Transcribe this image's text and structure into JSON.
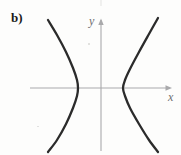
{
  "figure": {
    "part_label": "b)",
    "axis_labels": {
      "x": "x",
      "y": "y"
    },
    "colors": {
      "curve": "#2b2b2b",
      "axis": "#a9a9ab",
      "label_text": "#1a1a1a",
      "axis_label_text": "#6e6e70",
      "background": "#fdfdfc"
    }
  },
  "chart_data": {
    "type": "line",
    "title": "",
    "subtitle": "",
    "xlabel": "x",
    "ylabel": "y",
    "grid": false,
    "legend": null,
    "axes": {
      "origin_px": [
        101,
        88
      ],
      "x_axis_px": {
        "x1": 30,
        "y1": 88,
        "x2": 172,
        "y2": 88,
        "arrow": "right"
      },
      "y_axis_px": {
        "x1": 101,
        "y1": 18,
        "x2": 101,
        "y2": 151,
        "arrow": "up"
      },
      "xlim": [
        -3.6,
        1.8
      ],
      "ylim": [
        -1.8,
        1.8
      ],
      "ticks": []
    },
    "series": [
      {
        "name": "left-branch",
        "vertex": [
          -0.6,
          0
        ],
        "vertex_px": [
          78,
          88
        ],
        "points_px": [
          [
            48,
            20
          ],
          [
            57,
            35
          ],
          [
            66,
            52
          ],
          [
            73,
            68
          ],
          [
            77,
            80
          ],
          [
            78,
            88
          ],
          [
            77,
            96
          ],
          [
            73,
            108
          ],
          [
            66,
            124
          ],
          [
            57,
            140
          ],
          [
            48,
            152
          ]
        ]
      },
      {
        "name": "right-branch",
        "vertex": [
          0.6,
          0
        ],
        "vertex_px": [
          123,
          88
        ],
        "points_px": [
          [
            158,
            18
          ],
          [
            149,
            34
          ],
          [
            139,
            52
          ],
          [
            130,
            69
          ],
          [
            125,
            80
          ],
          [
            123,
            88
          ],
          [
            125,
            96
          ],
          [
            130,
            108
          ],
          [
            139,
            124
          ],
          [
            149,
            140
          ],
          [
            158,
            152
          ]
        ]
      }
    ]
  }
}
